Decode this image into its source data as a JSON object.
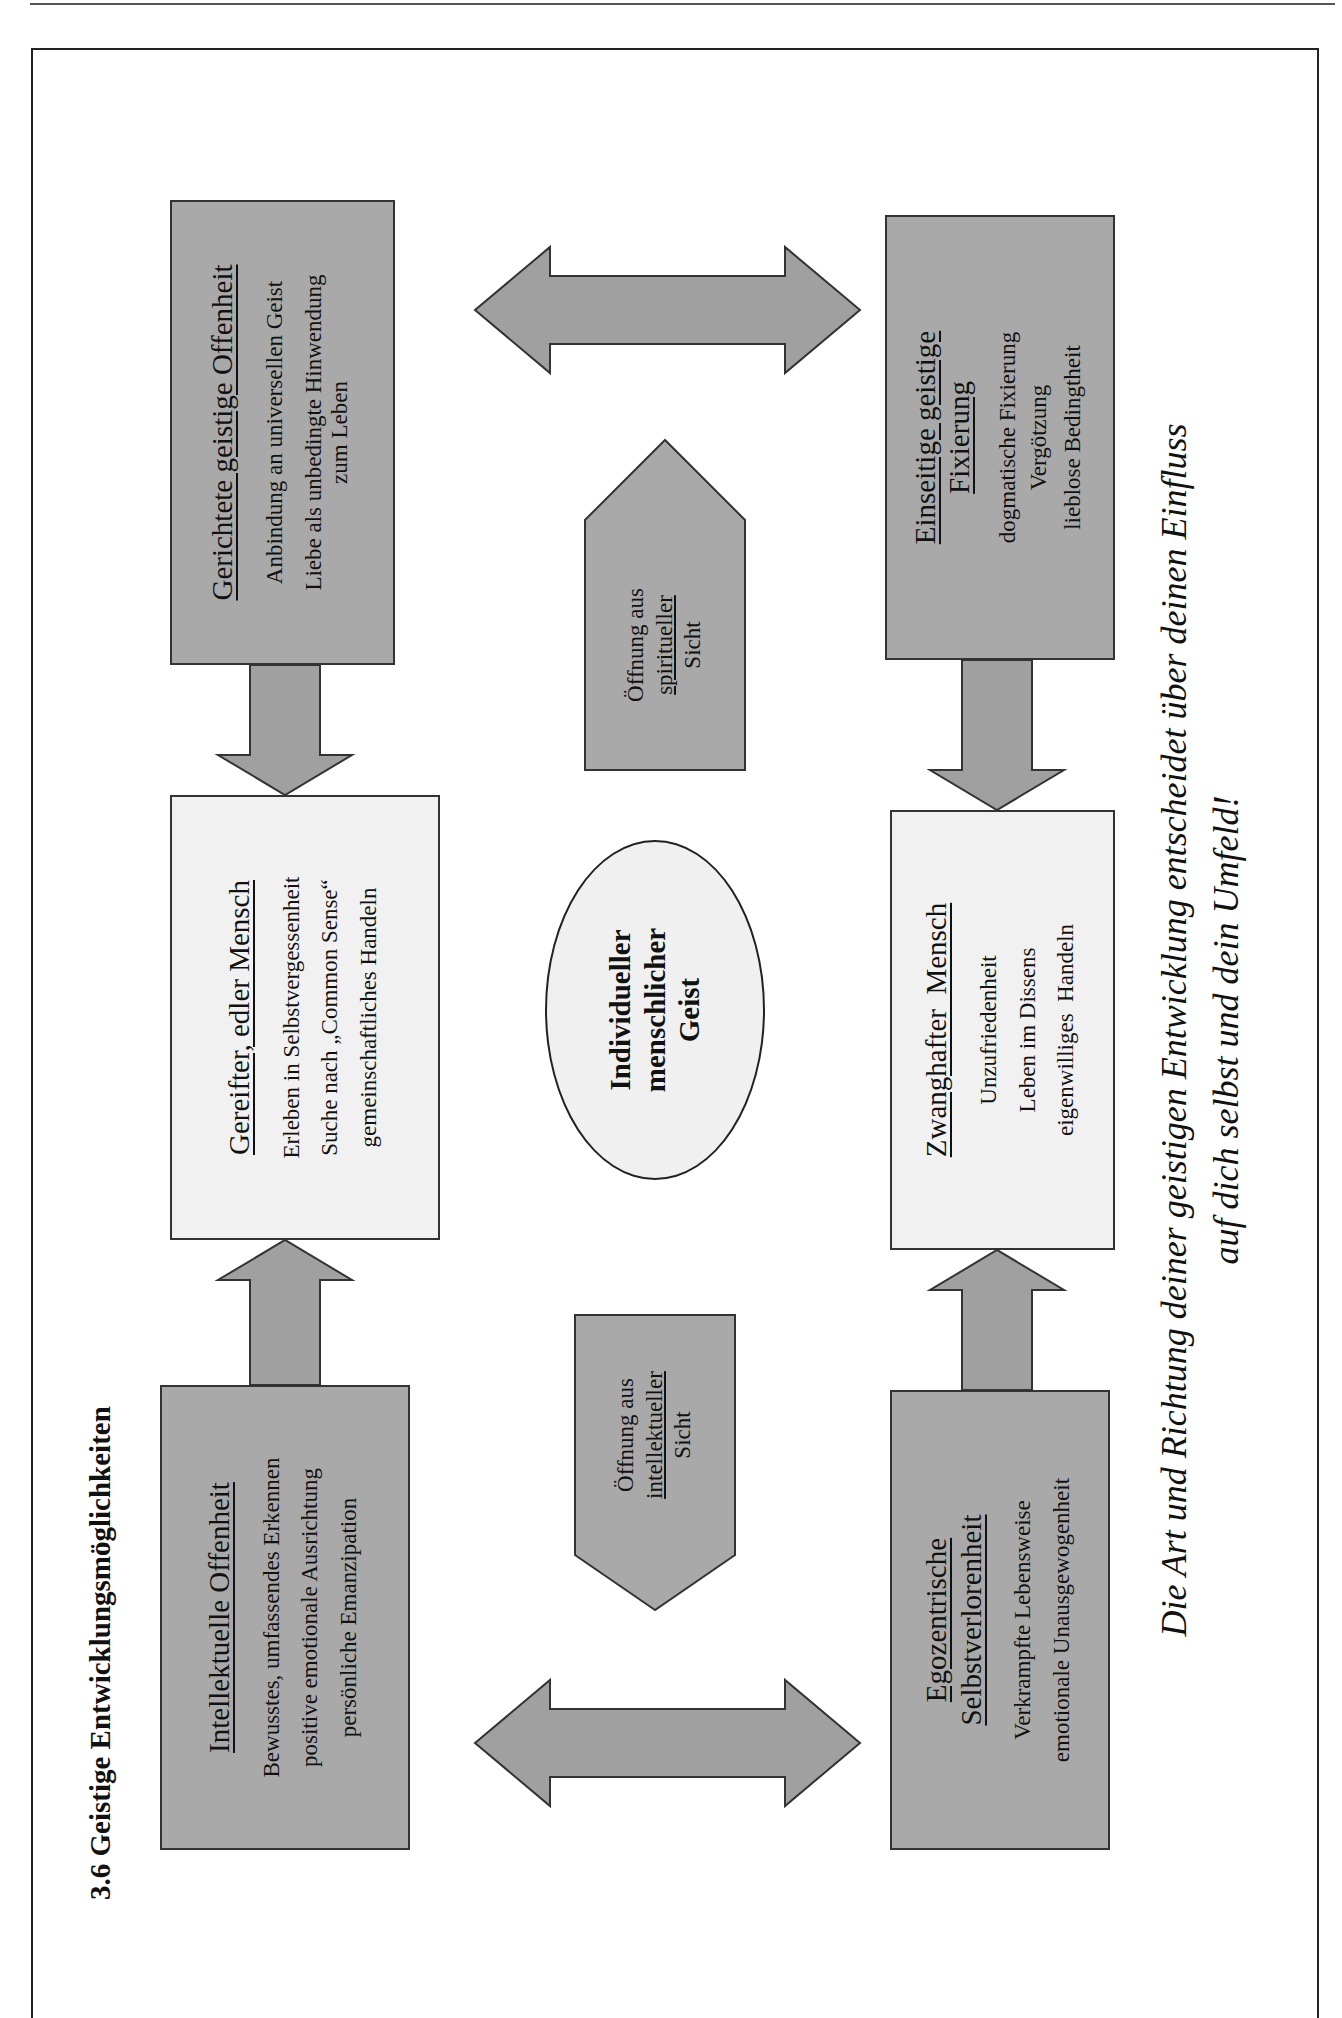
{
  "page": {
    "page_number": "99"
  },
  "title": "3.6  Geistige Entwicklungsmöglichkeiten",
  "boxes": {
    "intellektuelle": {
      "heading": "Intellektuelle Offenheit",
      "lines": [
        "Bewusstes, umfassendes Erkennen",
        "positive emotionale Ausrichtung",
        "persönliche Emanzipation"
      ]
    },
    "gereifter": {
      "heading": "Gereifter, edler Mensch",
      "lines": [
        "Erleben in Selbstvergessenheit",
        "Suche nach „Common Sense“",
        "gemeinschaftliches Handeln"
      ]
    },
    "gerichtete": {
      "heading": "Gerichtete geistige Offenheit",
      "lines": [
        "Anbindung an universellen Geist",
        "Liebe als unbedingte Hinwendung",
        "zum Leben"
      ]
    },
    "egozentrische": {
      "heading_1": "Egozentrische",
      "heading_2": "Selbstverlorenheit",
      "lines": [
        "Verkrampfte Lebensweise",
        "emotionale Unausgewogenheit"
      ]
    },
    "zwanghafter": {
      "heading": "Zwanghafter  Mensch",
      "lines": [
        "Unzufriedenheit",
        "Leben im Dissens",
        "eigenwilliges  Handeln"
      ]
    },
    "einseitige": {
      "heading_1": "Einseitige geistige",
      "heading_2": "Fixierung",
      "lines": [
        "dogmatische Fixierung",
        "Vergötzung",
        "lieblose Bedingtheit"
      ]
    }
  },
  "center": {
    "lines": [
      "Individueller",
      "menschlicher",
      "Geist"
    ]
  },
  "openings": {
    "intellectual": {
      "line1": "Öffnung aus",
      "line2": "intellektueller",
      "line3": "Sicht"
    },
    "spiritual": {
      "line1": "Öffnung aus",
      "line2": "spiritueller",
      "line3": "Sicht"
    }
  },
  "caption": {
    "line1": "Die Art und Richtung deiner geistigen Entwicklung entscheidet über deinen Einfluss",
    "line2": "auf dich selbst und dein Umfeld!"
  },
  "colors": {
    "dark_box": "#a9a9a9",
    "light_box": "#f1f1f1",
    "arrow": "#a0a0a0",
    "stroke": "#333333"
  }
}
